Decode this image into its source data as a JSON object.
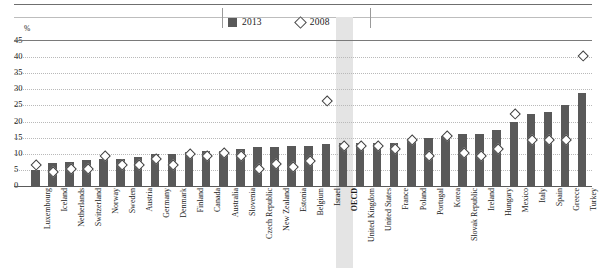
{
  "legend": {
    "items": [
      {
        "label": "2013",
        "marker": "filled-square",
        "color": "#595959"
      },
      {
        "label": "2008",
        "marker": "open-diamond",
        "color": "#ffffff"
      }
    ]
  },
  "axis": {
    "unit_label": "%",
    "ticks": [
      "45",
      "40",
      "35",
      "30",
      "25",
      "20",
      "15",
      "10",
      "5",
      "0"
    ]
  },
  "highlight": {
    "category": "OECD",
    "color": "#e4e4e4"
  },
  "chart_data": {
    "type": "bar",
    "title": "",
    "subtitle": "",
    "xlabel": "",
    "ylabel": "%",
    "ylim": [
      0,
      45
    ],
    "ytick_step": 5,
    "grid": true,
    "legend_position": "top-center",
    "categories": [
      "Luxembourg",
      "Iceland",
      "Netherlands",
      "Switzerland",
      "Norway",
      "Sweden",
      "Austria",
      "Germany",
      "Denmark",
      "Finland",
      "Canada",
      "Australia",
      "Slovenia",
      "Czech Republic",
      "New Zealand",
      "Estonia",
      "Belgium",
      "Israel",
      "OECD",
      "United Kingdom",
      "United States",
      "France",
      "Poland",
      "Portugal",
      "Korea",
      "Slovak Republic",
      "Ireland",
      "Hungary",
      "Mexico",
      "Italy",
      "Spain",
      "Greece",
      "Turkey"
    ],
    "series": [
      {
        "name": "2013",
        "type": "bar",
        "color": "#595959",
        "values": [
          5.0,
          7.0,
          7.5,
          8.0,
          8.5,
          8.5,
          9.0,
          10.0,
          10.0,
          10.5,
          11.0,
          11.0,
          11.5,
          12.0,
          12.0,
          12.5,
          12.5,
          13.0,
          13.5,
          13.5,
          13.5,
          13.5,
          14.0,
          15.0,
          15.5,
          16.0,
          16.0,
          17.5,
          20.0,
          22.5,
          23.0,
          25.0,
          29.0
        ]
      },
      {
        "name": "2008",
        "type": "scatter",
        "marker": "open-diamond",
        "color": "#ffffff",
        "edge_color": "#3f3f3f",
        "values": [
          6.0,
          4.0,
          5.0,
          5.0,
          9.0,
          6.0,
          6.0,
          8.0,
          6.0,
          9.5,
          9.0,
          10.0,
          9.0,
          5.0,
          6.5,
          5.5,
          7.5,
          26.0,
          12.0,
          12.0,
          12.0,
          11.0,
          14.0,
          9.0,
          15.0,
          10.0,
          9.0,
          11.0,
          22.0,
          14.0,
          14.0,
          14.0,
          40.0
        ]
      }
    ]
  }
}
